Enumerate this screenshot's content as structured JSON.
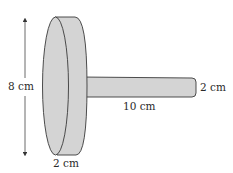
{
  "diagram": {
    "type": "cylinder-with-rod",
    "disk": {
      "diameter_label": "8 cm",
      "thickness_label": "2 cm"
    },
    "rod": {
      "length_label": "10 cm",
      "diameter_label": "2 cm"
    },
    "colors": {
      "fill": "#d4d4d4",
      "stroke": "#3a3a3a",
      "text": "#2a2a2a"
    }
  }
}
